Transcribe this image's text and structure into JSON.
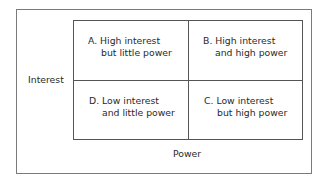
{
  "diagram": {
    "type": "power-interest grid",
    "y_axis_label": "Interest",
    "x_axis_label": "Power",
    "quadrants": [
      {
        "id": "A",
        "position": "top-left",
        "line1": "A. High interest",
        "line2": "but little power"
      },
      {
        "id": "B",
        "position": "top-right",
        "line1": "B. High interest",
        "line2": "and high power"
      },
      {
        "id": "D",
        "position": "bottom-left",
        "line1": "D. Low interest",
        "line2": "and little power"
      },
      {
        "id": "C",
        "position": "bottom-right",
        "line1": "C. Low interest",
        "line2": "but high power"
      }
    ]
  }
}
